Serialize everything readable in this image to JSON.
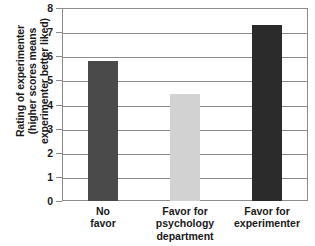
{
  "chart_data": {
    "type": "bar",
    "title": "",
    "subtitle": "",
    "xlabel": "",
    "ylabel_lines": [
      "Rating of experimenter",
      "(higher scores means",
      "experimenter better liked)"
    ],
    "ylabel": "Rating of experimenter (higher scores means experimenter better liked)",
    "categories": [
      "No favor",
      "Favor for psychology department",
      "Favor for experimenter"
    ],
    "category_lines": [
      [
        "No",
        "favor"
      ],
      [
        "Favor for",
        "psychology",
        "department"
      ],
      [
        "Favor for",
        "experimenter"
      ]
    ],
    "values": [
      5.8,
      4.45,
      7.3
    ],
    "bar_colors": [
      "#4a4a4a",
      "#d2d2d2",
      "#2b2b2b"
    ],
    "ylim": [
      0,
      8
    ],
    "yticks": [
      0,
      1,
      2,
      3,
      4,
      5,
      6,
      7,
      8
    ],
    "ytick_labels": [
      "0",
      "1",
      "2",
      "3",
      "4",
      "5",
      "6",
      "7",
      "8"
    ],
    "grid": true,
    "grid_color": "#8c8c8c",
    "legend": null,
    "legend_position": "none",
    "background": "#ffffff"
  }
}
